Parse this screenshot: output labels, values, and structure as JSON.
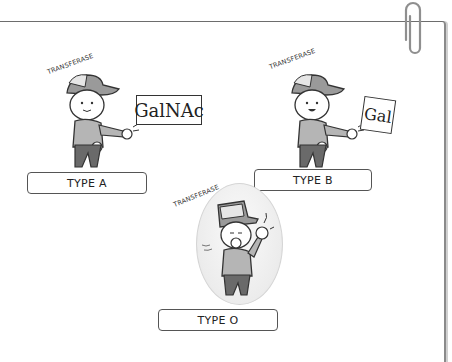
{
  "figures": [
    {
      "id": "type-a",
      "caption": "TYPE A",
      "enzyme": "TRANSFERASE",
      "sugar": "GalNAc",
      "action": "throwing"
    },
    {
      "id": "type-b",
      "caption": "TYPE B",
      "enzyme": "TRANSFERASE",
      "sugar": "Gal",
      "action": "throwing"
    },
    {
      "id": "type-o",
      "caption": "TYPE O",
      "enzyme": "TRANSFERASE",
      "sugar": "",
      "action": "coughing"
    }
  ],
  "colors": {
    "outline": "#333333",
    "cap": "#8c8c8c",
    "shirt": "#b5b5b5",
    "pants": "#6a6a6a",
    "paper_border": "#6d6d6d"
  }
}
